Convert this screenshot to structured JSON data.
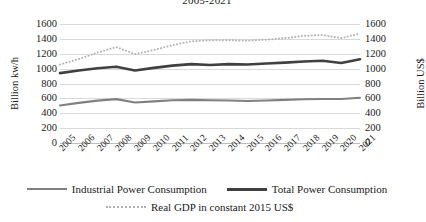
{
  "chart_data": {
    "type": "line",
    "title": "2005-2021",
    "xlabel": "",
    "ylabel": "Billion kw/h",
    "y2label": "Billion US$",
    "ylim": [
      0,
      1600
    ],
    "y2lim": [
      0,
      1600
    ],
    "yticks": [
      1600,
      1400,
      1200,
      1000,
      800,
      600,
      400,
      200,
      0
    ],
    "y2ticks": [
      1600,
      1400,
      1200,
      1000,
      800,
      600,
      400,
      200,
      0
    ],
    "grid": true,
    "legend_position": "bottom",
    "categories": [
      "2005",
      "2006",
      "2007",
      "2008",
      "2009",
      "2010",
      "2011",
      "2012",
      "2013",
      "2014",
      "2015",
      "2016",
      "2017",
      "2018",
      "2019",
      "2020",
      "2021"
    ],
    "series": [
      {
        "name": "Industrial Power Consumption",
        "style": "solid",
        "color": "#808080",
        "axis": "left",
        "values": [
          505,
          540,
          570,
          590,
          545,
          560,
          575,
          580,
          575,
          572,
          565,
          572,
          580,
          588,
          592,
          592,
          608
        ]
      },
      {
        "name": "Total Power Consumption",
        "style": "solid",
        "color": "#404040",
        "axis": "left",
        "values": [
          940,
          975,
          1005,
          1025,
          975,
          1010,
          1040,
          1060,
          1048,
          1060,
          1055,
          1068,
          1080,
          1095,
          1105,
          1075,
          1125
        ]
      },
      {
        "name": "Real GDP in constant 2015 US$",
        "style": "dotted",
        "color": "#b3b3b3",
        "axis": "right",
        "values": [
          1055,
          1130,
          1215,
          1290,
          1195,
          1250,
          1315,
          1368,
          1380,
          1382,
          1375,
          1390,
          1410,
          1440,
          1452,
          1410,
          1472
        ]
      }
    ]
  },
  "legend": {
    "items": [
      {
        "label": "Industrial Power Consumption",
        "swatch": "solid-thin"
      },
      {
        "label": "Total Power Consumption",
        "swatch": "solid-thick"
      },
      {
        "label": "Real GDP in constant 2015 US$",
        "swatch": "dotted"
      }
    ]
  }
}
